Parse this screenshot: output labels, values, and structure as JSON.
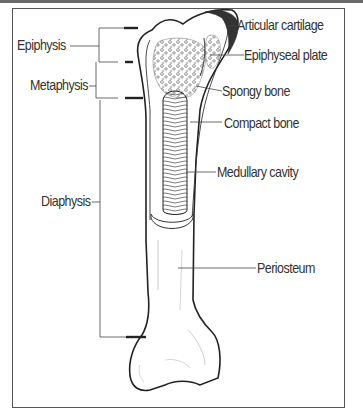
{
  "diagram": {
    "labels_left": {
      "epiphysis": "Epiphysis",
      "metaphysis": "Metaphysis",
      "diaphysis": "Diaphysis"
    },
    "labels_right": {
      "articular_cartilage": "Articular cartilage",
      "epiphyseal_plate": "Epiphyseal plate",
      "spongy_bone": "Spongy bone",
      "compact_bone": "Compact bone",
      "medullary_cavity": "Medullary cavity",
      "periosteum": "Periosteum"
    },
    "colors": {
      "line": "#333333",
      "frame": "#555555",
      "background": "#ffffff"
    }
  }
}
